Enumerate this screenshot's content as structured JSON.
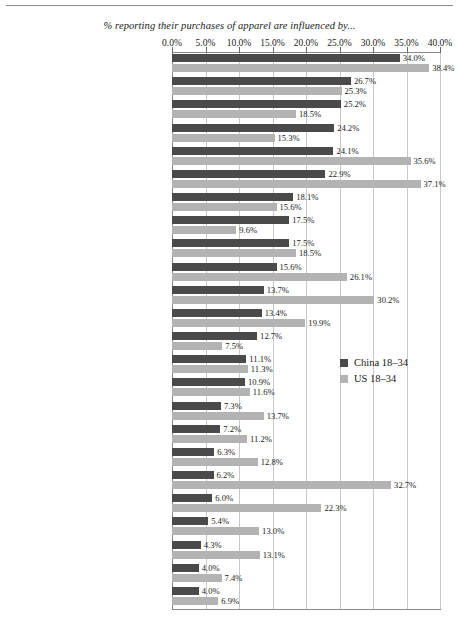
{
  "chart_data": {
    "type": "bar",
    "orientation": "horizontal",
    "title": "% reporting their purchases of apparel are influenced by...",
    "xlabel": "",
    "ylabel": "",
    "xlim": [
      0,
      40
    ],
    "xticks": [
      "0.0%",
      "5.0%",
      "10.0%",
      "15.0%",
      "20.0%",
      "25.0%",
      "30.0%",
      "35.0%",
      "40.0%"
    ],
    "xtick_values": [
      0,
      5,
      10,
      15,
      20,
      25,
      30,
      35,
      40
    ],
    "grid": true,
    "legend_position": "middle-right",
    "categories": [
      "In-store promotion",
      "TV broadcast",
      "Advertising inserts",
      "Product placement",
      "Word of mouth",
      "Coupons",
      "Read article on product",
      "IM",
      "Social media (e.g. QQ, Sina)",
      "Internet advertising",
      "Magazines",
      "Cable",
      "Web radio",
      "Outdoor billboards",
      "Blogging",
      "Radio",
      "Text messaging on cell phone",
      "Newspapers",
      "E-mail advertising",
      "Direct mail",
      "Mobile devices",
      "Watch video on cell phone",
      "Online video game advertising",
      "Yellow pages"
    ],
    "series": [
      {
        "name": "China 18–34",
        "color": "#4a4a4a",
        "values": [
          34.0,
          26.7,
          25.2,
          24.2,
          24.1,
          22.9,
          18.1,
          17.5,
          17.5,
          15.6,
          13.7,
          13.4,
          12.7,
          11.1,
          10.9,
          7.3,
          7.2,
          6.3,
          6.2,
          6.0,
          5.4,
          4.3,
          4.0,
          4.0
        ],
        "labels": [
          "34.0%",
          "26.7%",
          "25.2%",
          "24.2%",
          "24.1%",
          "22.9%",
          "18.1%",
          "17.5%",
          "17.5%",
          "15.6%",
          "13.7%",
          "13.4%",
          "12.7%",
          "11.1%",
          "10.9%",
          "7.3%",
          "7.2%",
          "6.3%",
          "6.2%",
          "6.0%",
          "5.4%",
          "4.3%",
          "4.0%",
          "4.0%"
        ]
      },
      {
        "name": "US 18–34",
        "color": "#b3b3b3",
        "values": [
          38.4,
          25.3,
          18.5,
          15.3,
          35.6,
          37.1,
          15.6,
          9.6,
          18.5,
          26.1,
          30.2,
          19.9,
          7.5,
          11.3,
          11.6,
          13.7,
          11.2,
          12.8,
          32.7,
          22.3,
          13.0,
          13.1,
          7.4,
          6.9
        ],
        "labels": [
          "38.4%",
          "25.3%",
          "18.5%",
          "15.3%",
          "35.6%",
          "37.1%",
          "15.6%",
          "9.6%",
          "18.5%",
          "26.1%",
          "30.2%",
          "19.9%",
          "7.5%",
          "11.3%",
          "11.6%",
          "13.7%",
          "11.2%",
          "12.8%",
          "32.7%",
          "22.3%",
          "13.0%",
          "13.1%",
          "7.4%",
          "6.9%"
        ]
      }
    ]
  },
  "legend": {
    "items": [
      {
        "label": "China 18–34",
        "color": "#4a4a4a"
      },
      {
        "label": "US 18–34",
        "color": "#b3b3b3"
      }
    ]
  },
  "colors": {
    "china": "#4a4a4a",
    "us": "#b3b3b3",
    "gridline": "#c8c8c8",
    "axis": "#8a8a8a",
    "text": "#1a1a1a"
  }
}
